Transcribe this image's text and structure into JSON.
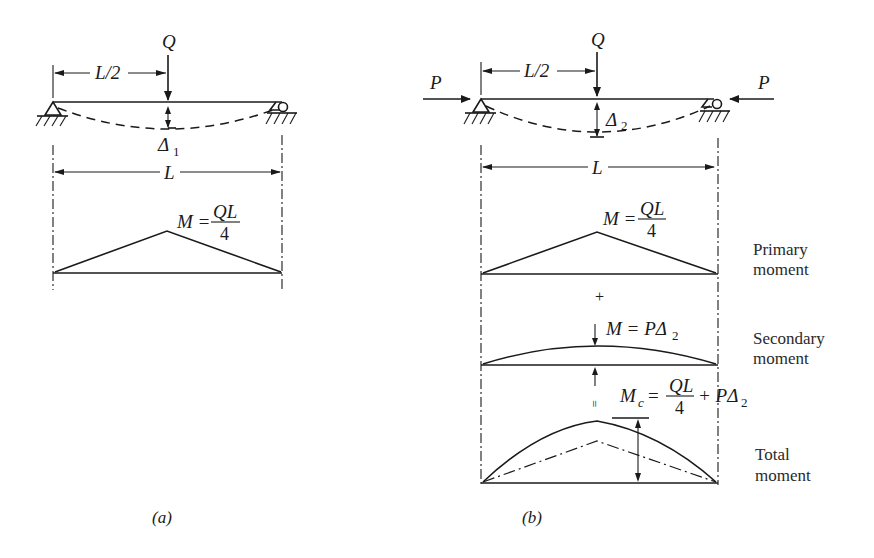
{
  "panel_a": {
    "caption": "(a)",
    "load_label": "Q",
    "half_span_label": "L/2",
    "deflection_label": "Δ",
    "deflection_sub": "1",
    "span_label": "L",
    "moment_lhs": "M =",
    "moment_num": "QL",
    "moment_den": "4"
  },
  "panel_b": {
    "caption": "(b)",
    "load_label": "Q",
    "axial_left": "P",
    "axial_right": "P",
    "half_span_label": "L/2",
    "deflection_label": "Δ",
    "deflection_sub": "2",
    "span_label": "L",
    "primary": {
      "lhs": "M =",
      "num": "QL",
      "den": "4",
      "label_line1": "Primary",
      "label_line2": "moment"
    },
    "plus_sign": "+",
    "secondary": {
      "expr": "M = PΔ",
      "sub": "2",
      "label_line1": "Secondary",
      "label_line2": "moment"
    },
    "equals_sign": "=",
    "total": {
      "lhs": "M",
      "lhs_sub": "c",
      "eq": "=",
      "num": "QL",
      "den": "4",
      "tail": "+ PΔ",
      "tail_sub": "2",
      "label_line1": "Total",
      "label_line2": "moment"
    }
  }
}
